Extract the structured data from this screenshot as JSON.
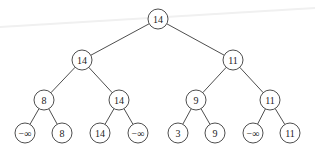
{
  "diagram": {
    "type": "binary-tree",
    "node_radius": 10,
    "nodes": [
      {
        "id": "n0",
        "label": "14",
        "x": 158,
        "y": 19
      },
      {
        "id": "n1",
        "label": "14",
        "x": 82,
        "y": 60
      },
      {
        "id": "n2",
        "label": "11",
        "x": 233,
        "y": 60
      },
      {
        "id": "n3",
        "label": "8",
        "x": 44,
        "y": 100
      },
      {
        "id": "n4",
        "label": "14",
        "x": 119,
        "y": 100
      },
      {
        "id": "n5",
        "label": "9",
        "x": 196,
        "y": 100
      },
      {
        "id": "n6",
        "label": "11",
        "x": 270,
        "y": 100
      },
      {
        "id": "n7",
        "label": "−∞",
        "x": 25,
        "y": 133
      },
      {
        "id": "n8",
        "label": "8",
        "x": 62,
        "y": 133
      },
      {
        "id": "n9",
        "label": "14",
        "x": 100,
        "y": 133
      },
      {
        "id": "n10",
        "label": "−∞",
        "x": 138,
        "y": 133
      },
      {
        "id": "n11",
        "label": "3",
        "x": 178,
        "y": 133
      },
      {
        "id": "n12",
        "label": "9",
        "x": 215,
        "y": 133
      },
      {
        "id": "n13",
        "label": "−∞",
        "x": 253,
        "y": 133
      },
      {
        "id": "n14",
        "label": "11",
        "x": 290,
        "y": 133
      }
    ],
    "edges": [
      [
        "n0",
        "n1"
      ],
      [
        "n0",
        "n2"
      ],
      [
        "n1",
        "n3"
      ],
      [
        "n1",
        "n4"
      ],
      [
        "n2",
        "n5"
      ],
      [
        "n2",
        "n6"
      ],
      [
        "n3",
        "n7"
      ],
      [
        "n3",
        "n8"
      ],
      [
        "n4",
        "n9"
      ],
      [
        "n4",
        "n10"
      ],
      [
        "n5",
        "n11"
      ],
      [
        "n5",
        "n12"
      ],
      [
        "n6",
        "n13"
      ],
      [
        "n6",
        "n14"
      ]
    ]
  }
}
